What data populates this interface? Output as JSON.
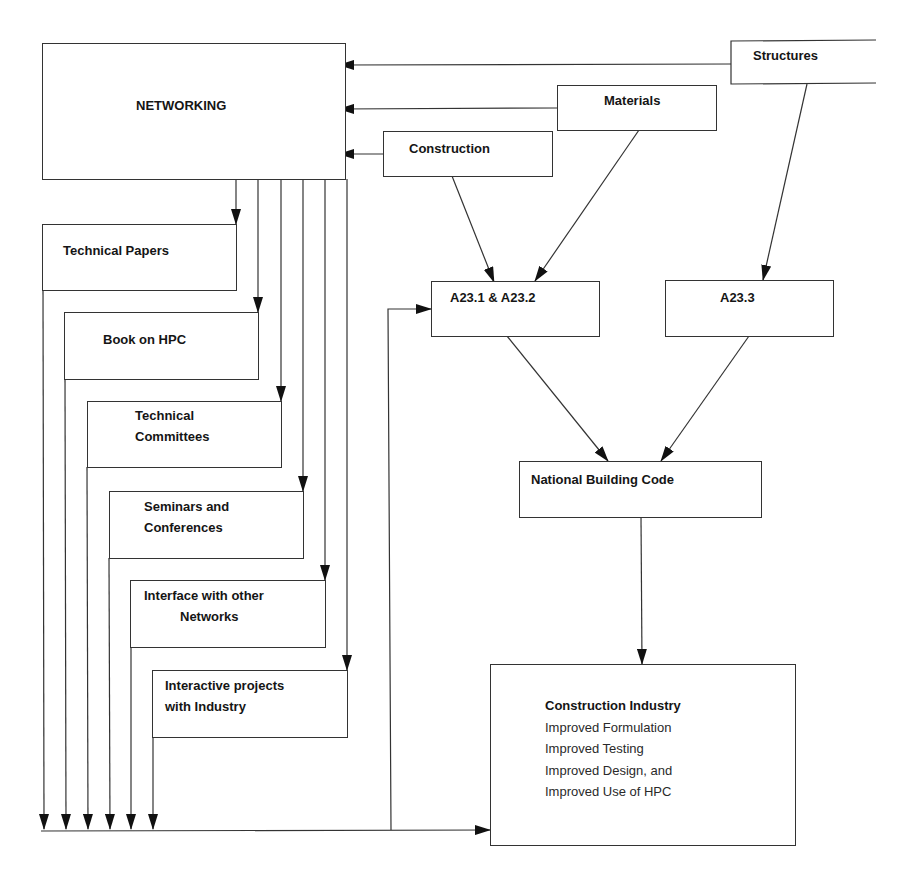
{
  "diagram": {
    "type": "flowchart",
    "nodes": {
      "networking": {
        "label": "NETWORKING"
      },
      "structures": {
        "label": "Structures"
      },
      "materials": {
        "label": "Materials"
      },
      "construction": {
        "label": "Construction"
      },
      "technical_papers": {
        "label": "Technical Papers"
      },
      "book_on_hpc": {
        "label": "Book on HPC"
      },
      "technical_committees": {
        "line1": "Technical",
        "line2": "Committees"
      },
      "seminars": {
        "line1": "Seminars and",
        "line2": "Conferences"
      },
      "interface": {
        "line1": "Interface with other",
        "line2": "Networks"
      },
      "interactive": {
        "line1": "Interactive projects",
        "line2": "with Industry"
      },
      "a231_a232": {
        "label": "A23.1 & A23.2"
      },
      "a233": {
        "label": "A23.3"
      },
      "nbc": {
        "label": "National Building Code"
      },
      "construction_industry": {
        "title": "Construction Industry",
        "items": [
          "Improved Formulation",
          "Improved Testing",
          "Improved Design, and",
          "Improved Use of HPC"
        ]
      }
    },
    "edges": [
      {
        "from": "Structures",
        "to": "NETWORKING"
      },
      {
        "from": "Materials",
        "to": "NETWORKING"
      },
      {
        "from": "Construction",
        "to": "NETWORKING"
      },
      {
        "from": "NETWORKING",
        "to": "Technical Papers"
      },
      {
        "from": "NETWORKING",
        "to": "Book on HPC"
      },
      {
        "from": "NETWORKING",
        "to": "Technical Committees"
      },
      {
        "from": "NETWORKING",
        "to": "Seminars and Conferences"
      },
      {
        "from": "NETWORKING",
        "to": "Interface with other Networks"
      },
      {
        "from": "NETWORKING",
        "to": "Interactive projects with Industry"
      },
      {
        "from": "Construction",
        "to": "A23.1 & A23.2"
      },
      {
        "from": "Materials",
        "to": "A23.1 & A23.2"
      },
      {
        "from": "Structures",
        "to": "A23.3"
      },
      {
        "from": "A23.1 & A23.2",
        "to": "National Building Code"
      },
      {
        "from": "A23.3",
        "to": "National Building Code"
      },
      {
        "from": "National Building Code",
        "to": "Construction Industry"
      },
      {
        "from": "Networking outputs (bus)",
        "to": "Construction Industry"
      },
      {
        "from": "Networking outputs (bus)",
        "to": "A23.1 & A23.2"
      }
    ]
  },
  "colors": {
    "line": "#333333",
    "text": "#151515",
    "background": "#ffffff"
  }
}
